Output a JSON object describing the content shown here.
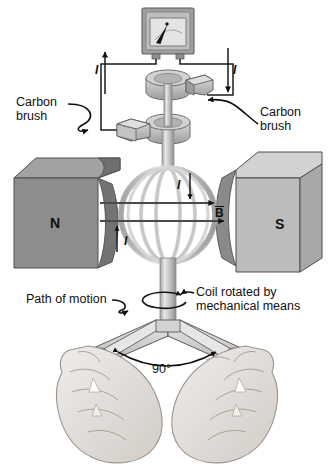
{
  "figure": {
    "kind": "ac-generator-diagram",
    "title_visible": false
  },
  "labels": {
    "carbon_brush_left": "Carbon\nbrush",
    "carbon_brush_right": "Carbon\nbrush",
    "path_of_motion": "Path of motion",
    "coil_rotated": "Coil rotated by\nmechanical means",
    "angle": "90°",
    "pole_north": "N",
    "pole_south": "S",
    "b_field": "B",
    "current_left_lead": "I",
    "current_right_lead": "I",
    "current_coil_left": "I",
    "current_coil_right": "I"
  },
  "components": {
    "meter": {
      "name": "galvanometer",
      "needle": true,
      "terminals": 2
    },
    "slip_rings": 2,
    "brushes": 2,
    "magnets": [
      {
        "pole": "N",
        "color": "#8d8d8d",
        "side": "left"
      },
      {
        "pole": "S",
        "color": "#b9b9b9",
        "side": "right"
      }
    ],
    "coil": {
      "shape": "circular-loop-cage",
      "color": "#c9c9c9"
    },
    "shaft": {
      "color": "#c4c4c4"
    },
    "hands": 2,
    "handle_angle_deg": 90
  },
  "colors": {
    "background": "#ffffff",
    "ink": "#111111",
    "magnet_n": "#8d8d8d",
    "magnet_n_top": "#9c9c9c",
    "magnet_n_notch": "#6e6e6e",
    "magnet_s": "#b9b9b9",
    "magnet_s_top": "#cfcfcf",
    "magnet_s_notch": "#8a8a8a",
    "metal_light": "#d6d6d6",
    "metal_mid": "#b5b5b5",
    "metal_dark": "#9a9a9a",
    "skin": "#e3e0dc",
    "skin_shade": "#cfcac4",
    "meter_face": "#d8d8d8",
    "meter_body": "#a9a9a9"
  }
}
